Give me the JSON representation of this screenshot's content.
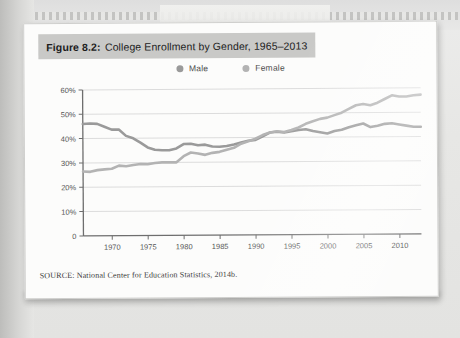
{
  "figure": {
    "label": "Figure 8.2:",
    "title": "College Enrollment by Gender, 1965–2013",
    "source": "SOURCE: National Center for Education Statistics, 2014b."
  },
  "colors": {
    "male_line": "#9a9a9a",
    "female_line": "#b3b3b3",
    "title_band": "#c9c9c7",
    "axis": "#6e6e6e",
    "grid": "#dcdcdc",
    "paper": "#fcfcfb"
  },
  "chart_data": {
    "type": "line",
    "title": "College Enrollment by Gender, 1965–2013",
    "xlabel": "",
    "ylabel": "",
    "xlim": [
      1966,
      2013
    ],
    "ylim": [
      0,
      60
    ],
    "grid": true,
    "legend_position": "top-center",
    "ytick_labels": [
      "0",
      "10%",
      "20%",
      "30%",
      "40%",
      "50%",
      "60%"
    ],
    "ytick_values": [
      0,
      10,
      20,
      30,
      40,
      50,
      60
    ],
    "xtick_labels": [
      "1970",
      "1975",
      "1980",
      "1985",
      "1990",
      "1995",
      "2000",
      "2005",
      "2010"
    ],
    "xtick_values": [
      1970,
      1975,
      1980,
      1985,
      1990,
      1995,
      2000,
      2005,
      2010
    ],
    "x": [
      1966,
      1967,
      1968,
      1969,
      1970,
      1971,
      1972,
      1973,
      1974,
      1975,
      1976,
      1977,
      1978,
      1979,
      1980,
      1981,
      1982,
      1983,
      1984,
      1985,
      1986,
      1987,
      1988,
      1989,
      1990,
      1991,
      1992,
      1993,
      1994,
      1995,
      1996,
      1997,
      1998,
      1999,
      2000,
      2001,
      2002,
      2003,
      2004,
      2005,
      2006,
      2007,
      2008,
      2009,
      2010,
      2011,
      2012,
      2013
    ],
    "series": [
      {
        "name": "Male",
        "color": "#9a9a9a",
        "marker": "circle",
        "values": [
          46.0,
          46.2,
          46.0,
          44.8,
          43.6,
          43.6,
          41.0,
          40.0,
          38.2,
          36.2,
          35.2,
          35.0,
          35.0,
          35.7,
          37.5,
          37.6,
          37.0,
          37.2,
          36.4,
          36.3,
          36.6,
          37.2,
          38.0,
          38.7,
          39.0,
          40.5,
          42.0,
          42.3,
          42.0,
          42.5,
          43.0,
          43.3,
          42.5,
          42.0,
          41.5,
          42.5,
          43.0,
          44.0,
          44.8,
          45.5,
          44.0,
          44.5,
          45.3,
          45.5,
          45.0,
          44.5,
          44.0,
          44.0
        ]
      },
      {
        "name": "Female",
        "color": "#b3b3b3",
        "marker": "circle",
        "values": [
          26.5,
          26.3,
          27.0,
          27.3,
          27.5,
          28.8,
          28.5,
          29.0,
          29.4,
          29.3,
          29.8,
          30.0,
          30.0,
          30.0,
          32.5,
          34.0,
          33.6,
          33.0,
          33.8,
          34.2,
          35.0,
          35.8,
          37.5,
          38.5,
          39.5,
          41.0,
          42.0,
          42.5,
          42.2,
          43.0,
          44.0,
          45.5,
          46.5,
          47.5,
          48.0,
          49.0,
          50.0,
          51.5,
          53.0,
          53.5,
          53.0,
          54.0,
          55.5,
          57.0,
          56.5,
          56.5,
          57.0,
          57.2
        ]
      }
    ]
  },
  "legend": [
    {
      "label": "Male",
      "color": "#9a9a9a"
    },
    {
      "label": "Female",
      "color": "#b3b3b3"
    }
  ]
}
